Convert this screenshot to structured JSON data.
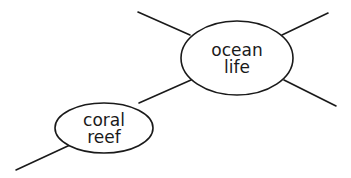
{
  "diagram": {
    "type": "mind-map",
    "stroke_color": "#1a1a1a",
    "background": "#ffffff",
    "nodes": [
      {
        "id": "ocean-life",
        "lines": [
          "ocean",
          "life"
        ],
        "cx": 237,
        "cy": 58,
        "rx": 56,
        "ry": 37
      },
      {
        "id": "coral-reef",
        "lines": [
          "coral",
          "reef"
        ],
        "cx": 104,
        "cy": 128,
        "rx": 49,
        "ry": 25
      }
    ],
    "edges": [
      {
        "id": "ocean-branch-top-left",
        "from": "ocean-life",
        "x1": 190,
        "y1": 35,
        "x2": 138,
        "y2": 12
      },
      {
        "id": "ocean-branch-top-right",
        "from": "ocean-life",
        "x1": 282,
        "y1": 35,
        "x2": 328,
        "y2": 13
      },
      {
        "id": "ocean-branch-bottom-right",
        "from": "ocean-life",
        "x1": 284,
        "y1": 80,
        "x2": 336,
        "y2": 106
      },
      {
        "id": "coral-to-ocean",
        "from": "coral-reef",
        "to": "ocean-life",
        "x1": 139,
        "y1": 103,
        "x2": 191,
        "y2": 80
      },
      {
        "id": "coral-branch-bottom-left",
        "from": "coral-reef",
        "x1": 70,
        "y1": 145,
        "x2": 16,
        "y2": 170
      }
    ]
  }
}
